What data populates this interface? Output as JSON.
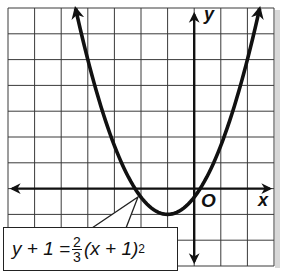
{
  "chart_data": {
    "type": "line",
    "title": "",
    "equation": "y + 1 = 2/3(x + 1)^2",
    "equation_parts": {
      "lhs": "y + 1 =",
      "frac_num": "2",
      "frac_den": "3",
      "rhs": "(x + 1)",
      "exp": "2"
    },
    "xlabel": "x",
    "ylabel": "y",
    "origin_label": "O",
    "xlim": [
      -7,
      3
    ],
    "ylim": [
      -3,
      7
    ],
    "grid": true,
    "grid_step": 1,
    "tick_labels_shown": false,
    "vertex": [
      -1,
      -1
    ],
    "x_intercepts": [
      -2.22,
      0.22
    ],
    "y_intercept": -0.33,
    "series": [
      {
        "name": "y + 1 = 2/3(x + 1)^2",
        "x": [
          -4.46,
          -4,
          -3,
          -2,
          -1,
          0,
          1,
          2,
          2.46
        ],
        "y": [
          7,
          5,
          1.67,
          -0.33,
          -1,
          -0.33,
          1.67,
          5,
          7
        ]
      }
    ],
    "annotations": [
      {
        "text": "y + 1 = 2/3(x + 1)^2",
        "points_to": [
          -2.2,
          -0.3
        ],
        "position": "bottom-left"
      }
    ]
  },
  "labels": {
    "x": "x",
    "y": "y",
    "origin": "O"
  },
  "colors": {
    "grid": "#333333",
    "curve": "#111111",
    "axis": "#111111",
    "background": "#ffffff"
  }
}
